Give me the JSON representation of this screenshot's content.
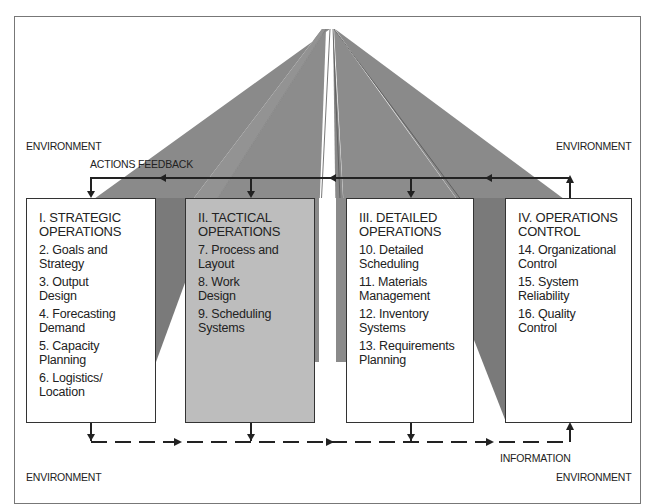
{
  "labels": {
    "env_top_left": "ENVIRONMENT",
    "env_top_right": "ENVIRONMENT",
    "env_bottom_left": "ENVIRONMENT",
    "env_bottom_right": "ENVIRONMENT",
    "actions_feedback": "ACTIONS FEEDBACK",
    "information": "INFORMATION"
  },
  "boxes": [
    {
      "title_line1": "I. STRATEGIC",
      "title_line2": "OPERATIONS",
      "fill": "#ffffff",
      "items": [
        {
          "l1": "2. Goals and",
          "l2": "Strategy"
        },
        {
          "l1": "3. Output",
          "l2": "Design"
        },
        {
          "l1": "4. Forecasting",
          "l2": "Demand"
        },
        {
          "l1": "5. Capacity",
          "l2": "Planning"
        },
        {
          "l1": "6. Logistics/",
          "l2": "Location"
        }
      ]
    },
    {
      "title_line1": "II. TACTICAL",
      "title_line2": "OPERATIONS",
      "fill": "#bdbdbd",
      "items": [
        {
          "l1": "7. Process and",
          "l2": "Layout"
        },
        {
          "l1": "8. Work",
          "l2": "Design"
        },
        {
          "l1": "9. Scheduling",
          "l2": "Systems"
        }
      ]
    },
    {
      "title_line1": "III. DETAILED",
      "title_line2": "OPERATIONS",
      "fill": "#ffffff",
      "items": [
        {
          "l1": "10. Detailed",
          "l2": "Scheduling"
        },
        {
          "l1": "11. Materials",
          "l2": "Management"
        },
        {
          "l1": "12. Inventory",
          "l2": "Systems"
        },
        {
          "l1": "13. Requirements",
          "l2": "Planning"
        }
      ]
    },
    {
      "title_line1": "IV. OPERATIONS",
      "title_line2": "CONTROL",
      "fill": "#ffffff",
      "items": [
        {
          "l1": "14. Organizational",
          "l2": "Control"
        },
        {
          "l1": "15. System",
          "l2": "Reliability"
        },
        {
          "l1": "16. Quality",
          "l2": "Control"
        }
      ]
    }
  ],
  "colors": {
    "wedge": "#8a8a8a",
    "wedge_dark": "#6f6f6f",
    "gray_box": "#bdbdbd",
    "line": "#222222"
  }
}
